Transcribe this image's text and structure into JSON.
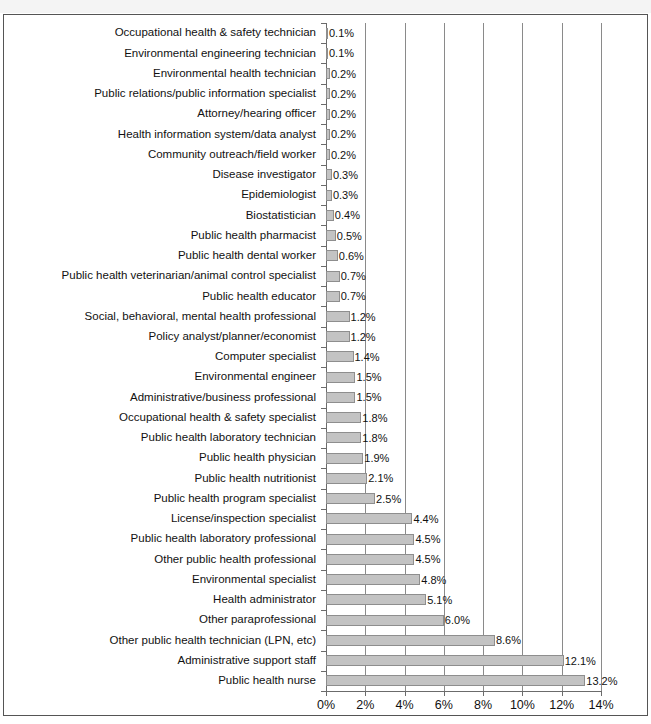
{
  "page": {
    "header_strip": "",
    "background": "#ffffff",
    "frame_color": "#555555"
  },
  "chart_data": {
    "type": "bar",
    "orientation": "horizontal",
    "title": "",
    "subtitle": "",
    "xlabel": "",
    "ylabel": "",
    "xlim": [
      0,
      14
    ],
    "grid": true,
    "grid_axis": "x",
    "legend": "none",
    "bar_color": "#c3c3c3",
    "bar_border_color": "#8e8e8e",
    "gridline_color": "#8a8a8a",
    "axis_color": "#6b6b6b",
    "value_suffix": "%",
    "xticks": [
      0,
      2,
      4,
      6,
      8,
      10,
      12,
      14
    ],
    "xticklabels": [
      "0%",
      "2%",
      "4%",
      "6%",
      "8%",
      "10%",
      "12%",
      "14%"
    ],
    "categories": [
      "Occupational health & safety technician",
      "Environmental engineering technician",
      "Environmental health technician",
      "Public relations/public information specialist",
      "Attorney/hearing officer",
      "Health information system/data analyst",
      "Community outreach/field worker",
      "Disease investigator",
      "Epidemiologist",
      "Biostatistician",
      "Public health pharmacist",
      "Public health dental worker",
      "Public health veterinarian/animal control specialist",
      "Public health educator",
      "Social, behavioral, mental health professional",
      "Policy analyst/planner/economist",
      "Computer specialist",
      "Environmental engineer",
      "Administrative/business professional",
      "Occupational health & safety specialist",
      "Public health laboratory technician",
      "Public health physician",
      "Public health nutritionist",
      "Public health program specialist",
      "License/inspection specialist",
      "Public health laboratory professional",
      "Other public health professional",
      "Environmental specialist",
      "Health administrator",
      "Other paraprofessional",
      "Other public health technician (LPN, etc)",
      "Administrative support staff",
      "Public health nurse"
    ],
    "values": [
      0.1,
      0.1,
      0.2,
      0.2,
      0.2,
      0.2,
      0.2,
      0.3,
      0.3,
      0.4,
      0.5,
      0.6,
      0.7,
      0.7,
      1.2,
      1.2,
      1.4,
      1.5,
      1.5,
      1.8,
      1.8,
      1.9,
      2.1,
      2.5,
      4.4,
      4.5,
      4.5,
      4.8,
      5.1,
      6.0,
      8.6,
      12.1,
      13.2
    ],
    "value_labels": [
      "0.1%",
      "0.1%",
      "0.2%",
      "0.2%",
      "0.2%",
      "0.2%",
      "0.2%",
      "0.3%",
      "0.3%",
      "0.4%",
      "0.5%",
      "0.6%",
      "0.7%",
      "0.7%",
      "1.2%",
      "1.2%",
      "1.4%",
      "1.5%",
      "1.5%",
      "1.8%",
      "1.8%",
      "1.9%",
      "2.1%",
      "2.5%",
      "4.4%",
      "4.5%",
      "4.5%",
      "4.8%",
      "5.1%",
      "6.0%",
      "8.6%",
      "12.1%",
      "13.2%"
    ]
  }
}
